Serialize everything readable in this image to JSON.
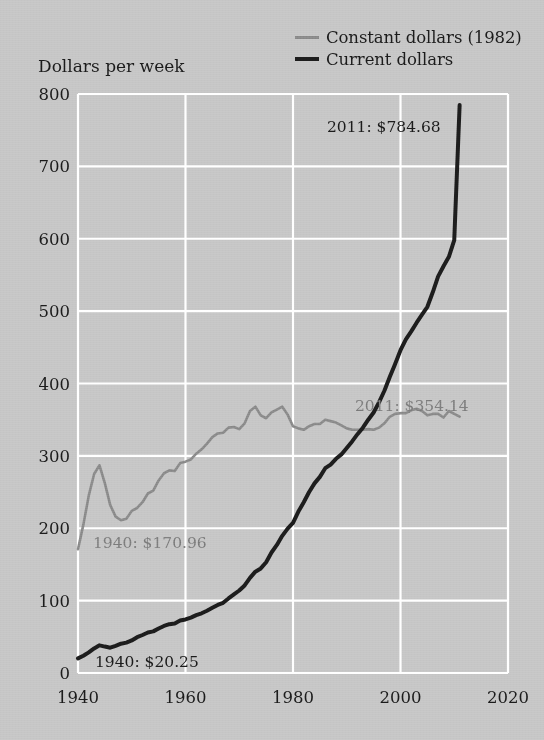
{
  "chart_data": {
    "type": "line",
    "title": "",
    "ylabel": "Dollars per week",
    "xlabel": "",
    "xlim": [
      1940,
      2020
    ],
    "ylim": [
      0,
      800
    ],
    "xticks": [
      "1940",
      "1960",
      "1980",
      "2000",
      "2020"
    ],
    "yticks": [
      "0",
      "100",
      "200",
      "300",
      "400",
      "500",
      "600",
      "700",
      "800"
    ],
    "grid": true,
    "legend_position": "top-right",
    "colors": {
      "constant": "#8a8a8a",
      "current": "#1d1d1d",
      "background": "#c6c6c6",
      "gridline": "#ffffff",
      "text": "#1b1b1b",
      "gray_text": "#7c7c7c"
    },
    "series": [
      {
        "name": "Constant dollars (1982)",
        "color": "#8a8a8a",
        "x": [
          1940,
          1941,
          1942,
          1943,
          1944,
          1945,
          1946,
          1947,
          1948,
          1949,
          1950,
          1951,
          1952,
          1953,
          1954,
          1955,
          1956,
          1957,
          1958,
          1959,
          1960,
          1961,
          1962,
          1963,
          1964,
          1965,
          1966,
          1967,
          1968,
          1969,
          1970,
          1971,
          1972,
          1973,
          1974,
          1975,
          1976,
          1977,
          1978,
          1979,
          1980,
          1981,
          1982,
          1983,
          1984,
          1985,
          1986,
          1987,
          1988,
          1989,
          1990,
          1991,
          1992,
          1993,
          1994,
          1995,
          1996,
          1997,
          1998,
          1999,
          2000,
          2001,
          2002,
          2003,
          2004,
          2005,
          2006,
          2007,
          2008,
          2009,
          2010,
          2011
        ],
        "y": [
          170.96,
          205,
          245,
          275,
          287,
          262,
          232,
          216,
          211,
          213,
          224,
          228,
          236,
          248,
          252,
          266,
          276,
          280,
          279,
          290,
          292,
          295,
          303,
          309,
          317,
          326,
          331,
          332,
          339,
          340,
          337,
          345,
          362,
          368,
          356,
          352,
          360,
          364,
          368,
          357,
          341,
          338,
          336,
          341,
          344,
          344,
          350,
          348,
          346,
          342,
          338,
          336,
          336,
          336,
          337,
          336,
          339,
          345,
          354,
          358,
          359,
          359,
          363,
          365,
          362,
          356,
          358,
          358,
          353,
          362,
          358,
          354.14
        ],
        "annotations": [
          {
            "text": "1940: $170.96",
            "x": 1942,
            "y": 155
          },
          {
            "text": "2011: $354.14",
            "x": 1995,
            "y": 390
          }
        ]
      },
      {
        "name": "Current dollars",
        "color": "#1d1d1d",
        "x": [
          1940,
          1941,
          1942,
          1943,
          1944,
          1945,
          1946,
          1947,
          1948,
          1949,
          1950,
          1951,
          1952,
          1953,
          1954,
          1955,
          1956,
          1957,
          1958,
          1959,
          1960,
          1961,
          1962,
          1963,
          1964,
          1965,
          1966,
          1967,
          1968,
          1969,
          1970,
          1971,
          1972,
          1973,
          1974,
          1975,
          1976,
          1977,
          1978,
          1979,
          1980,
          1981,
          1982,
          1983,
          1984,
          1985,
          1986,
          1987,
          1988,
          1989,
          1990,
          1991,
          1992,
          1993,
          1994,
          1995,
          1996,
          1997,
          1998,
          1999,
          2000,
          2001,
          2002,
          2003,
          2004,
          2005,
          2006,
          2007,
          2008,
          2009,
          2010,
          2011
        ],
        "y": [
          20.25,
          23.9,
          28.5,
          34.0,
          38.2,
          36.5,
          35.0,
          37.5,
          40.5,
          42.0,
          45.0,
          49.5,
          52.5,
          56.0,
          57.5,
          61.5,
          65.0,
          67.5,
          68.5,
          72.5,
          74.0,
          76.5,
          80.0,
          82.5,
          86.0,
          90.0,
          94.0,
          97.0,
          103.0,
          108.5,
          114.0,
          121.0,
          131.5,
          140.0,
          144.5,
          153.0,
          166.5,
          177.0,
          189.5,
          199.5,
          207.5,
          223.0,
          236.0,
          250.0,
          262.0,
          271.0,
          283.0,
          288.0,
          296.0,
          302.0,
          311.0,
          320.0,
          330.0,
          339.0,
          350.0,
          360.0,
          374.0,
          390.0,
          409.0,
          427.0,
          446.0,
          461.0,
          472.0,
          484.0,
          495.0,
          506.0,
          526.0,
          548.0,
          562.0,
          575.0,
          598.0,
          784.68
        ],
        "annotations": [
          {
            "text": "1940: $20.25",
            "x": 1944,
            "y": 38
          },
          {
            "text": "2011: $784.68",
            "x": 1988,
            "y": 735
          }
        ]
      }
    ]
  },
  "legend": {
    "items": [
      {
        "label": "Constant dollars (1982)",
        "style": "constant"
      },
      {
        "label": "Current dollars",
        "style": "current"
      }
    ]
  },
  "axis": {
    "y_title": "Dollars per week"
  },
  "annotations": {
    "current_2011": "2011: $784.68",
    "constant_2011": "2011: $354.14",
    "constant_1940": "1940: $170.96",
    "current_1940": "1940: $20.25"
  }
}
